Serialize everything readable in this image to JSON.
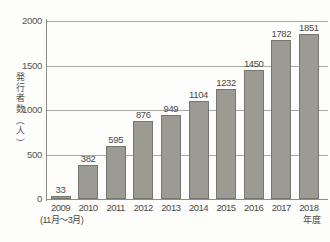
{
  "chart_data": {
    "type": "bar",
    "title": "",
    "xlabel": "年度",
    "ylabel": "発行者数（人）",
    "categories": [
      "2009",
      "2010",
      "2011",
      "2012",
      "2013",
      "2014",
      "2015",
      "2016",
      "2017",
      "2018"
    ],
    "values": [
      33,
      382,
      595,
      876,
      949,
      1104,
      1232,
      1450,
      1782,
      1851
    ],
    "ylim": [
      0,
      2000
    ],
    "yticks": [
      0,
      500,
      1000,
      1500,
      2000
    ],
    "ytick_labels": [
      "0",
      "500",
      "1000",
      "1500",
      "2000"
    ],
    "grid": true,
    "legend": false,
    "annotations": {
      "first_category_note": "(11月～3月)",
      "last_category_note": "年度"
    },
    "series": [
      {
        "name": "発行者数",
        "values": [
          33,
          382,
          595,
          876,
          949,
          1104,
          1232,
          1450,
          1782,
          1851
        ]
      }
    ]
  },
  "axis": {
    "y_caption_chars": [
      "発",
      "行",
      "者",
      "数"
    ],
    "y_caption_unit_open": "（",
    "y_caption_unit": "人",
    "y_caption_unit_close": "）"
  },
  "colors": {
    "bar_fill": "#9b9b94",
    "bar_stroke": "#76766f",
    "gridline": "#a9a9a4",
    "axis": "#8e8e88",
    "text": "#4a4a45",
    "background": "#fdfdfc"
  },
  "footer": {
    "strip_text": ""
  }
}
